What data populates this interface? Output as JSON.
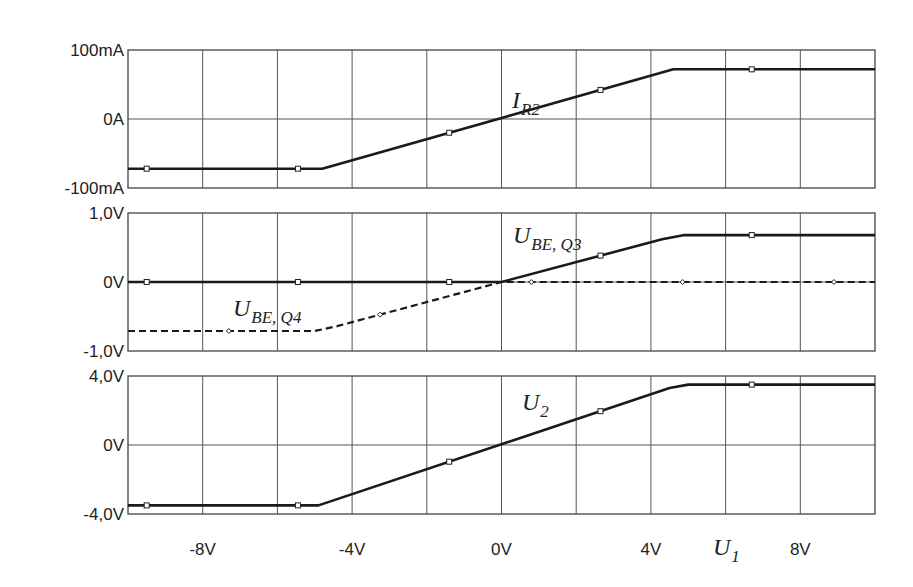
{
  "chart_data": {
    "type": "line",
    "layout": "3 stacked panels sharing x-axis",
    "x_axis": {
      "label": "U1",
      "label_display": {
        "main": "U",
        "sub": "1"
      },
      "range": [
        -10,
        10
      ],
      "unit": "V",
      "grid_step": 2,
      "tick_values": [
        -8,
        -4,
        0,
        4,
        8
      ],
      "tick_labels": [
        "-8V",
        "-4V",
        "0V",
        "4V",
        "8V"
      ]
    },
    "grid": true,
    "panels": [
      {
        "name": "current-panel",
        "ylim": [
          -100,
          100
        ],
        "unit": "mA",
        "y_tick_values": [
          100,
          0,
          -100
        ],
        "y_tick_labels": [
          "100mA",
          "0A",
          "-100mA"
        ],
        "series": [
          {
            "name": "I_R2",
            "label_display": {
              "main": "I",
              "sub": "R2"
            },
            "style": "solid",
            "marker": "square",
            "x": [
              -10,
              -4.8,
              4.6,
              10
            ],
            "y": [
              -72,
              -72,
              72,
              72
            ]
          }
        ]
      },
      {
        "name": "ube-panel",
        "ylim": [
          -1.0,
          1.0
        ],
        "unit": "V",
        "y_tick_values": [
          1.0,
          0,
          -1.0
        ],
        "y_tick_labels": [
          "1,0V",
          "0V",
          "-1,0V"
        ],
        "series": [
          {
            "name": "U_BE,Q3",
            "label_display": {
              "main": "U",
              "sub": "BE, Q3"
            },
            "style": "solid",
            "marker": "square",
            "x": [
              -10,
              0,
              4.3,
              4.9,
              10
            ],
            "y": [
              0,
              0,
              0.62,
              0.68,
              0.68
            ]
          },
          {
            "name": "U_BE,Q4",
            "label_display": {
              "main": "U",
              "sub": "BE, Q4"
            },
            "style": "dashed",
            "marker": "diamond",
            "x": [
              -10,
              -5.0,
              -4.4,
              0,
              10
            ],
            "y": [
              -0.71,
              -0.71,
              -0.64,
              0,
              0
            ]
          }
        ]
      },
      {
        "name": "output-panel",
        "ylim": [
          -4.0,
          4.0
        ],
        "unit": "V",
        "y_tick_values": [
          4.0,
          0,
          -4.0
        ],
        "y_tick_labels": [
          "4,0V",
          "0V",
          "-4,0V"
        ],
        "series": [
          {
            "name": "U_2",
            "label_display": {
              "main": "U",
              "sub": "2"
            },
            "style": "solid",
            "marker": "square",
            "x": [
              -10,
              -4.9,
              4.5,
              5.0,
              10
            ],
            "y": [
              -3.5,
              -3.5,
              3.3,
              3.5,
              3.5
            ]
          }
        ]
      }
    ]
  }
}
